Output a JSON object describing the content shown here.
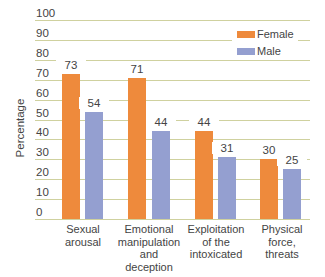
{
  "chart_data": {
    "type": "bar",
    "title": "",
    "xlabel": "",
    "ylabel": "Percentage",
    "ylim": [
      0,
      100
    ],
    "yticks": [
      0,
      10,
      20,
      30,
      40,
      50,
      60,
      70,
      80,
      90,
      100
    ],
    "grid": true,
    "legend_position": "top-right",
    "categories": [
      "Sexual arousal",
      "Emotional manipulation and deception",
      "Exploitation of the intoxicated",
      "Physical force, threats"
    ],
    "category_label_lines": [
      [
        "Sexual",
        "arousal"
      ],
      [
        "Emotional",
        "manipulation",
        "and",
        "deception"
      ],
      [
        "Exploitation",
        "of the",
        "intoxicated"
      ],
      [
        "Physical",
        "force,",
        "threats"
      ]
    ],
    "series": [
      {
        "name": "Female",
        "color": "#ee8a3c",
        "values": [
          73,
          71,
          44,
          30
        ]
      },
      {
        "name": "Male",
        "color": "#949fd0",
        "values": [
          54,
          44,
          31,
          25
        ]
      }
    ]
  },
  "legend": {
    "female": "Female",
    "male": "Male"
  }
}
